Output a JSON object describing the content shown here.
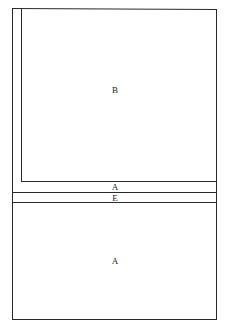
{
  "diagram": {
    "regions": [
      {
        "id": "upper",
        "label": "B"
      },
      {
        "id": "band1",
        "label": "A"
      },
      {
        "id": "band2",
        "label": "E"
      },
      {
        "id": "lower",
        "label": "A"
      }
    ]
  }
}
